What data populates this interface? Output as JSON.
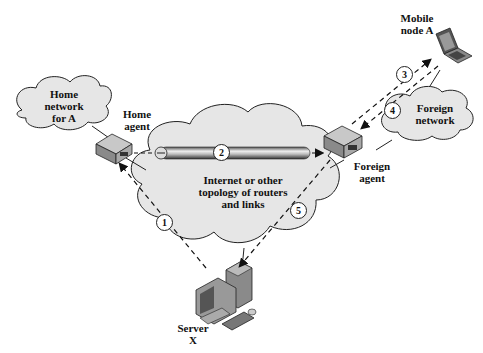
{
  "diagram": {
    "nodes": {
      "home_network": "Home\nnetwork\nfor A",
      "home_agent": "Home\nagent",
      "internet": "Internet or other\ntopology of routers\nand links",
      "foreign_agent": "Foreign\nagent",
      "foreign_network": "Foreign\nnetwork",
      "mobile_node": "Mobile\nnode A",
      "server": "Server\nX"
    },
    "steps": [
      "1",
      "2",
      "3",
      "4",
      "5"
    ],
    "edges": [
      {
        "step": "1",
        "from": "Server X",
        "to": "Home agent",
        "style": "dashed"
      },
      {
        "step": "2",
        "from": "Home agent",
        "to": "Foreign agent",
        "style": "tunnel"
      },
      {
        "step": "3",
        "from": "Foreign agent",
        "to": "Mobile node A",
        "style": "dashed"
      },
      {
        "step": "4",
        "from": "Mobile node A",
        "to": "Foreign agent",
        "style": "dashed"
      },
      {
        "step": "5",
        "from": "Foreign agent",
        "to": "Server X",
        "style": "dashed"
      }
    ],
    "colors": {
      "cloud_fill": "#e6e6e6",
      "stroke": "#222222",
      "device": "#9a9a9a"
    }
  }
}
